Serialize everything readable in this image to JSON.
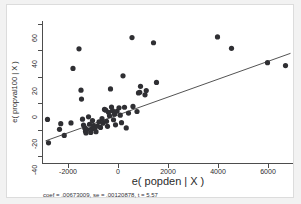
{
  "chart_data": {
    "type": "scatter",
    "title": "",
    "xlabel": "e( popden | X )",
    "ylabel": "e( propval100 | X )",
    "xlim": [
      -3000,
      7000
    ],
    "ylim": [
      -45,
      62
    ],
    "xticks": [
      -2000,
      0,
      2000,
      4000,
      6000
    ],
    "yticks": [
      -40,
      -20,
      0,
      20,
      40,
      60
    ],
    "xtick_labels": [
      "-2000",
      "0",
      "2000",
      "4000",
      "6000"
    ],
    "ytick_labels": [
      "-40",
      "-20",
      "0",
      "20",
      "40",
      "60"
    ],
    "grid": false,
    "legend": null,
    "annotation": "coef = .00673009, se = .00120878, t = 5.57",
    "fit_line": {
      "type": "linear",
      "slope": 0.00673009,
      "intercept": -8.8,
      "x_start": -2900,
      "x_end": 6900
    },
    "points": [
      {
        "x": -2820,
        "y": -12.2
      },
      {
        "x": -2780,
        "y": -29.8
      },
      {
        "x": -2340,
        "y": -19.6
      },
      {
        "x": -2290,
        "y": -15.4
      },
      {
        "x": -2150,
        "y": -24.2
      },
      {
        "x": -1880,
        "y": -14.8
      },
      {
        "x": -1800,
        "y": 26.3
      },
      {
        "x": -1560,
        "y": 41.0
      },
      {
        "x": -1480,
        "y": 9.9
      },
      {
        "x": -1460,
        "y": 3.2
      },
      {
        "x": -1420,
        "y": -12.0
      },
      {
        "x": -1380,
        "y": -16.4
      },
      {
        "x": -1330,
        "y": -18.6
      },
      {
        "x": -1300,
        "y": -21.0
      },
      {
        "x": -1280,
        "y": -22.4
      },
      {
        "x": -1240,
        "y": -19.8
      },
      {
        "x": -1180,
        "y": -10.2
      },
      {
        "x": -1140,
        "y": -15.8
      },
      {
        "x": -1090,
        "y": -22.0
      },
      {
        "x": -1060,
        "y": -19.3
      },
      {
        "x": -1020,
        "y": -13.0
      },
      {
        "x": -980,
        "y": -16.8
      },
      {
        "x": -940,
        "y": -19.0
      },
      {
        "x": -880,
        "y": -21.4
      },
      {
        "x": -820,
        "y": -17.2
      },
      {
        "x": -760,
        "y": -14.0
      },
      {
        "x": -700,
        "y": -18.2
      },
      {
        "x": -640,
        "y": -11.6
      },
      {
        "x": -600,
        "y": -15.0
      },
      {
        "x": -540,
        "y": -4.6
      },
      {
        "x": -490,
        "y": -5.2
      },
      {
        "x": -460,
        "y": -13.6
      },
      {
        "x": -420,
        "y": -17.4
      },
      {
        "x": -380,
        "y": -6.8
      },
      {
        "x": -340,
        "y": -9.4
      },
      {
        "x": -300,
        "y": 10.8
      },
      {
        "x": -260,
        "y": -2.8
      },
      {
        "x": -220,
        "y": -5.6
      },
      {
        "x": -180,
        "y": -12.4
      },
      {
        "x": -140,
        "y": -8.2
      },
      {
        "x": -100,
        "y": -16.2
      },
      {
        "x": -40,
        "y": -6.0
      },
      {
        "x": 40,
        "y": -3.4
      },
      {
        "x": 90,
        "y": -9.0
      },
      {
        "x": 140,
        "y": -14.6
      },
      {
        "x": 200,
        "y": 20.7
      },
      {
        "x": 260,
        "y": -3.0
      },
      {
        "x": 330,
        "y": -18.6
      },
      {
        "x": 420,
        "y": -7.4
      },
      {
        "x": 560,
        "y": 49.5
      },
      {
        "x": 600,
        "y": -2.4
      },
      {
        "x": 760,
        "y": -6.2
      },
      {
        "x": 820,
        "y": 7.8
      },
      {
        "x": 870,
        "y": 8.3
      },
      {
        "x": 900,
        "y": 12.8
      },
      {
        "x": 1080,
        "y": 6.4
      },
      {
        "x": 1130,
        "y": 9.6
      },
      {
        "x": 1420,
        "y": 45.6
      },
      {
        "x": 1540,
        "y": 15.7
      },
      {
        "x": 3980,
        "y": 50.0
      },
      {
        "x": 4540,
        "y": 41.4
      },
      {
        "x": 5980,
        "y": 30.6
      },
      {
        "x": 6700,
        "y": 28.4
      }
    ]
  }
}
